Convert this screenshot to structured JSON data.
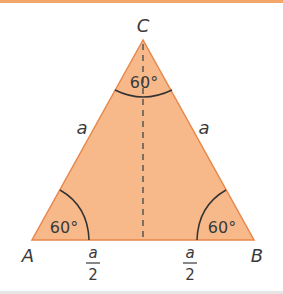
{
  "figure": {
    "type": "equilateral triangle",
    "fill_color": "#f7b98a",
    "edge_color": "#e8874a",
    "vertices": {
      "A": "A",
      "B": "B",
      "C": "C"
    },
    "sides": {
      "left": "a",
      "right": "a"
    },
    "angles": {
      "A": "60°",
      "B": "60°",
      "C": "60°"
    },
    "half_base": {
      "left": {
        "num": "a",
        "den": "2"
      },
      "right": {
        "num": "a",
        "den": "2"
      }
    }
  }
}
